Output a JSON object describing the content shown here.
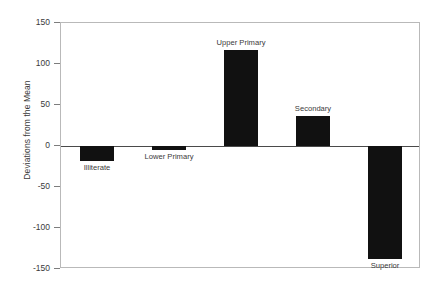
{
  "chart_data": {
    "type": "bar",
    "title": "",
    "xlabel": "",
    "ylabel": "Deviations from the Mean",
    "categories": [
      "Illiterate",
      "Lower Primary",
      "Upper Primary",
      "Secondary",
      "Superior"
    ],
    "values": [
      -18,
      -5,
      117,
      37,
      -138
    ],
    "ylim": [
      -150,
      150
    ],
    "yticks": [
      150,
      100,
      50,
      0,
      -50,
      -100,
      -150
    ],
    "ytick_labels": [
      "150",
      "100",
      "50",
      "0",
      "-50",
      "-100",
      "-150"
    ],
    "grid": false,
    "legend": null,
    "bar_color": "#111111",
    "axis_color": "#4a4a4a",
    "frame_color": "#b9b9b9",
    "orientation": "vertical",
    "baseline": 0
  },
  "axis": {
    "y_title": "Deviations from the Mean"
  }
}
